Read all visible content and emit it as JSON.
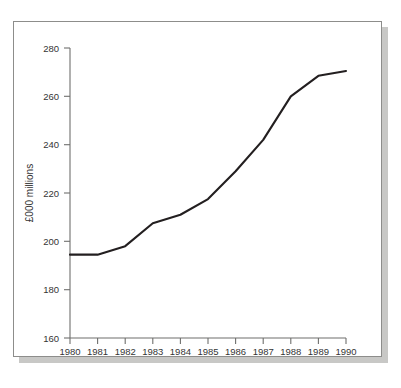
{
  "figure": {
    "frame_color": "#8d8d8b",
    "shadow_color": "#c8c8c6",
    "background": "#ffffff"
  },
  "chart_data": {
    "type": "line",
    "title": "",
    "xlabel": "",
    "ylabel": "£000 millions",
    "categories": [
      "1980",
      "1981",
      "1982",
      "1983",
      "1984",
      "1985",
      "1986",
      "1987",
      "1988",
      "1989",
      "1990"
    ],
    "x": [
      1980,
      1981,
      1982,
      1983,
      1984,
      1985,
      1986,
      1987,
      1988,
      1989,
      1990
    ],
    "values": [
      194.5,
      194.5,
      198,
      207.5,
      211,
      217.5,
      229,
      242,
      260,
      268.5,
      270.5
    ],
    "series": [
      {
        "name": "",
        "values": [
          194.5,
          194.5,
          198,
          207.5,
          211,
          217.5,
          229,
          242,
          260,
          268.5,
          270.5
        ],
        "color": "#231f20"
      }
    ],
    "ylim": [
      160,
      280
    ],
    "xlim": [
      1980,
      1990
    ],
    "yticks": [
      160,
      180,
      200,
      220,
      240,
      260,
      280
    ],
    "ytick_labels": [
      "160",
      "180",
      "200",
      "220",
      "240",
      "260",
      "280"
    ],
    "xticks": [
      1980,
      1981,
      1982,
      1983,
      1984,
      1985,
      1986,
      1987,
      1988,
      1989,
      1990
    ],
    "xtick_labels": [
      "1980",
      "1981",
      "1982",
      "1983",
      "1984",
      "1985",
      "1986",
      "1987",
      "1988",
      "1989",
      "1990"
    ],
    "grid": false,
    "legend": false,
    "legend_position": "none",
    "axis_color": "#6f6f6d",
    "line_color": "#231f20",
    "line_width": 2.1,
    "tick_direction": "outward"
  },
  "axis_labels": {
    "y_title": "£000 millions",
    "y_0": "160",
    "y_1": "180",
    "y_2": "200",
    "y_3": "220",
    "y_4": "240",
    "y_5": "260",
    "y_6": "280",
    "x_0": "1980",
    "x_1": "1981",
    "x_2": "1982",
    "x_3": "1983",
    "x_4": "1984",
    "x_5": "1985",
    "x_6": "1986",
    "x_7": "1987",
    "x_8": "1988",
    "x_9": "1989",
    "x_10": "1990"
  }
}
